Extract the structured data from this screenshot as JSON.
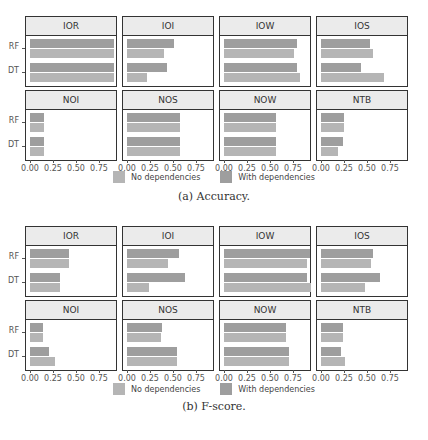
{
  "chart_data": [
    {
      "type": "bar",
      "orientation": "horizontal",
      "title": "Accuracy",
      "caption": "(a) Accuracy.",
      "categories": [
        "RF",
        "DT"
      ],
      "xlim": [
        0,
        0.95
      ],
      "xticks": [
        "0.00",
        "0.25",
        "0.50",
        "0.75"
      ],
      "legend": [
        "No dependencies",
        "With dependencies"
      ],
      "legend_position": "bottom",
      "facets": [
        {
          "name": "IOR",
          "series": [
            {
              "name": "With dependencies",
              "values": [
                0.91,
                0.91
              ]
            },
            {
              "name": "No dependencies",
              "values": [
                0.91,
                0.91
              ]
            }
          ]
        },
        {
          "name": "IOI",
          "series": [
            {
              "name": "With dependencies",
              "values": [
                0.51,
                0.43
              ]
            },
            {
              "name": "No dependencies",
              "values": [
                0.4,
                0.22
              ]
            }
          ]
        },
        {
          "name": "IOW",
          "series": [
            {
              "name": "With dependencies",
              "values": [
                0.79,
                0.79
              ]
            },
            {
              "name": "No dependencies",
              "values": [
                0.76,
                0.83
              ]
            }
          ]
        },
        {
          "name": "IOS",
          "series": [
            {
              "name": "With dependencies",
              "values": [
                0.53,
                0.43
              ]
            },
            {
              "name": "No dependencies",
              "values": [
                0.57,
                0.68
              ]
            }
          ]
        },
        {
          "name": "NOI",
          "series": [
            {
              "name": "With dependencies",
              "values": [
                0.15,
                0.15
              ]
            },
            {
              "name": "No dependencies",
              "values": [
                0.15,
                0.15
              ]
            }
          ]
        },
        {
          "name": "NOS",
          "series": [
            {
              "name": "With dependencies",
              "values": [
                0.58,
                0.58
              ]
            },
            {
              "name": "No dependencies",
              "values": [
                0.58,
                0.58
              ]
            }
          ]
        },
        {
          "name": "NOW",
          "series": [
            {
              "name": "With dependencies",
              "values": [
                0.56,
                0.56
              ]
            },
            {
              "name": "No dependencies",
              "values": [
                0.56,
                0.56
              ]
            }
          ]
        },
        {
          "name": "NTB",
          "series": [
            {
              "name": "With dependencies",
              "values": [
                0.25,
                0.24
              ]
            },
            {
              "name": "No dependencies",
              "values": [
                0.25,
                0.19
              ]
            }
          ]
        }
      ]
    },
    {
      "type": "bar",
      "orientation": "horizontal",
      "title": "F-score",
      "caption": "(b) F-score.",
      "categories": [
        "RF",
        "DT"
      ],
      "xlim": [
        0,
        0.95
      ],
      "xticks": [
        "0.00",
        "0.25",
        "0.50",
        "0.75"
      ],
      "legend": [
        "No dependencies",
        "With dependencies"
      ],
      "legend_position": "bottom",
      "facets": [
        {
          "name": "IOR",
          "series": [
            {
              "name": "With dependencies",
              "values": [
                0.42,
                0.33
              ]
            },
            {
              "name": "No dependencies",
              "values": [
                0.42,
                0.33
              ]
            }
          ]
        },
        {
          "name": "IOI",
          "series": [
            {
              "name": "With dependencies",
              "values": [
                0.57,
                0.63
              ]
            },
            {
              "name": "No dependencies",
              "values": [
                0.45,
                0.24
              ]
            }
          ]
        },
        {
          "name": "IOW",
          "series": [
            {
              "name": "With dependencies",
              "values": [
                0.93,
                0.9
              ]
            },
            {
              "name": "No dependencies",
              "values": [
                0.9,
                0.95
              ]
            }
          ]
        },
        {
          "name": "IOS",
          "series": [
            {
              "name": "With dependencies",
              "values": [
                0.57,
                0.64
              ]
            },
            {
              "name": "No dependencies",
              "values": [
                0.54,
                0.48
              ]
            }
          ]
        },
        {
          "name": "NOI",
          "series": [
            {
              "name": "With dependencies",
              "values": [
                0.14,
                0.21
              ]
            },
            {
              "name": "No dependencies",
              "values": [
                0.14,
                0.27
              ]
            }
          ]
        },
        {
          "name": "NOS",
          "series": [
            {
              "name": "With dependencies",
              "values": [
                0.38,
                0.54
              ]
            },
            {
              "name": "No dependencies",
              "values": [
                0.37,
                0.54
              ]
            }
          ]
        },
        {
          "name": "NOW",
          "series": [
            {
              "name": "With dependencies",
              "values": [
                0.67,
                0.71
              ]
            },
            {
              "name": "No dependencies",
              "values": [
                0.67,
                0.71
              ]
            }
          ]
        },
        {
          "name": "NTB",
          "series": [
            {
              "name": "With dependencies",
              "values": [
                0.24,
                0.22
              ]
            },
            {
              "name": "No dependencies",
              "values": [
                0.24,
                0.26
              ]
            }
          ]
        }
      ]
    }
  ],
  "colors": {
    "with_dependencies": "#9e9e9e",
    "no_dependencies": "#b5b5b5"
  },
  "legend": {
    "no_label": "No dependencies",
    "with_label": "With dependencies"
  },
  "captions": {
    "a": "(a) Accuracy.",
    "b": "(b) F-score."
  }
}
